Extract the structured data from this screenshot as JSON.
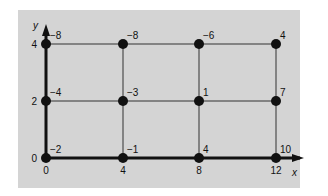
{
  "diagram": {
    "title": "",
    "type": "grid-graph",
    "axes": {
      "x_label": "x",
      "y_label": "y",
      "x_ticks": [
        "0",
        "4",
        "8",
        "12"
      ],
      "y_ticks": [
        "0",
        "2",
        "4"
      ]
    },
    "x_values": [
      0,
      4,
      8,
      12
    ],
    "y_values": [
      0,
      2,
      4
    ],
    "nodes": [
      {
        "x": 0,
        "y": 4,
        "value": "−8"
      },
      {
        "x": 4,
        "y": 4,
        "value": "−8"
      },
      {
        "x": 8,
        "y": 4,
        "value": "−6"
      },
      {
        "x": 12,
        "y": 4,
        "value": "4"
      },
      {
        "x": 0,
        "y": 2,
        "value": "−4"
      },
      {
        "x": 4,
        "y": 2,
        "value": "−3"
      },
      {
        "x": 8,
        "y": 2,
        "value": "1"
      },
      {
        "x": 12,
        "y": 2,
        "value": "7"
      },
      {
        "x": 0,
        "y": 0,
        "value": "−2"
      },
      {
        "x": 4,
        "y": 0,
        "value": "−1"
      },
      {
        "x": 8,
        "y": 0,
        "value": "4"
      },
      {
        "x": 12,
        "y": 0,
        "value": "10"
      }
    ],
    "colors": {
      "panel": "#d4d4d4",
      "line": "#333333",
      "axis": "#111111",
      "node": "#111111",
      "text": "#111111"
    }
  }
}
